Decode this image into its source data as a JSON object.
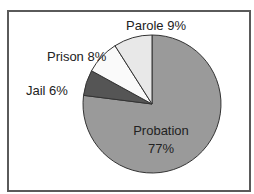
{
  "chart_data": {
    "type": "pie",
    "title": "",
    "categories": [
      "Probation",
      "Jail",
      "Prison",
      "Parole"
    ],
    "values": [
      77,
      6,
      8,
      9
    ],
    "unit": "%",
    "colors": {
      "Probation": "#9a9a9a",
      "Jail": "#555555",
      "Prison": "#fafafa",
      "Parole": "#e8e8e8"
    },
    "labels": [
      {
        "category": "Parole",
        "text": "Parole 9%"
      },
      {
        "category": "Prison",
        "text": "Prison 8%"
      },
      {
        "category": "Jail",
        "text": "Jail 6%"
      },
      {
        "category": "Probation",
        "text": "Probation",
        "value_text": "77%"
      }
    ],
    "legend": "none",
    "start_angle": "12 o'clock",
    "direction": "clockwise"
  },
  "labels": {
    "parole": "Parole 9%",
    "prison": "Prison 8%",
    "jail": "Jail 6%",
    "probation_name": "Probation",
    "probation_value": "77%"
  }
}
